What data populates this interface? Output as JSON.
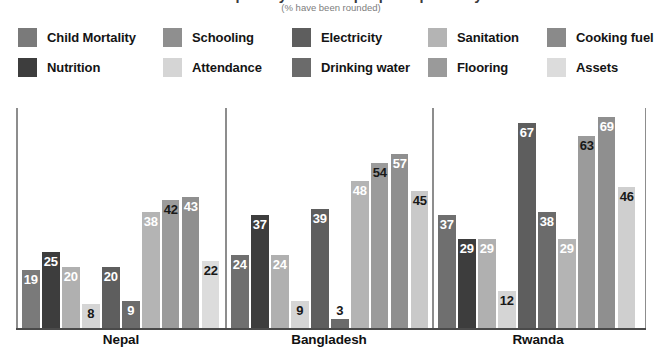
{
  "title": {
    "main": "Multidimensional poverty: share of people deprived by indicator",
    "sub": "(% have been rounded)"
  },
  "legend": {
    "columns": [
      [
        {
          "label": "Child Mortality",
          "color": "#7a7a7a",
          "swatch_name": "legend-swatch-child-mortality"
        },
        {
          "label": "Nutrition",
          "color": "#3d3d3d",
          "swatch_name": "legend-swatch-nutrition"
        }
      ],
      [
        {
          "label": "Schooling",
          "color": "#8f8f8f",
          "swatch_name": "legend-swatch-schooling"
        },
        {
          "label": "Attendance",
          "color": "#d5d5d5",
          "swatch_name": "legend-swatch-attendance"
        }
      ],
      [
        {
          "label": "Electricity",
          "color": "#5e5e5e",
          "swatch_name": "legend-swatch-electricity"
        },
        {
          "label": "Drinking water",
          "color": "#6b6b6b",
          "swatch_name": "legend-swatch-drinking-water"
        }
      ],
      [
        {
          "label": "Sanitation",
          "color": "#b4b4b4",
          "swatch_name": "legend-swatch-sanitation"
        },
        {
          "label": "Flooring",
          "color": "#9a9a9a",
          "swatch_name": "legend-swatch-flooring"
        }
      ],
      [
        {
          "label": "Cooking fuel",
          "color": "#8a8a8a",
          "swatch_name": "legend-swatch-cooking-fuel"
        },
        {
          "label": "Assets",
          "color": "#dcdcdc",
          "swatch_name": "legend-swatch-assets"
        }
      ]
    ]
  },
  "chart_data": {
    "type": "bar",
    "title": "Multidimensional poverty: share of people deprived by indicator",
    "subtitle": "(% have been rounded)",
    "xlabel": "",
    "ylabel": "",
    "ylim": [
      0,
      72
    ],
    "grid": false,
    "legend_position": "top",
    "categories": [
      "Nepal",
      "Bangladesh",
      "Rwanda"
    ],
    "indicators": [
      "Child Mortality",
      "Nutrition",
      "Schooling",
      "Attendance",
      "Electricity",
      "Drinking water",
      "Sanitation",
      "Cooking fuel",
      "Flooring",
      "Assets"
    ],
    "series": [
      {
        "name": "Child Mortality",
        "color": "#7a7a7a",
        "values": [
          19,
          24,
          37
        ]
      },
      {
        "name": "Nutrition",
        "color": "#3d3d3d",
        "values": [
          25,
          37,
          29
        ]
      },
      {
        "name": "Schooling",
        "color": "#9f9f9f",
        "values": [
          20,
          24,
          29
        ]
      },
      {
        "name": "Attendance",
        "color": "#d5d5d5",
        "values": [
          8,
          9,
          12
        ]
      },
      {
        "name": "Electricity",
        "color": "#5e5e5e",
        "values": [
          20,
          39,
          67
        ]
      },
      {
        "name": "Drinking water",
        "color": "#6b6b6b",
        "values": [
          9,
          3,
          38
        ]
      },
      {
        "name": "Sanitation",
        "color": "#b4b4b4",
        "values": [
          38,
          48,
          29
        ]
      },
      {
        "name": "Cooking fuel",
        "color": "#8a8a8a",
        "values": [
          42,
          54,
          63
        ]
      },
      {
        "name": "Flooring",
        "color": "#9a9a9a",
        "values": [
          43,
          57,
          69
        ]
      },
      {
        "name": "Assets",
        "color": "#dcdcdc",
        "values": [
          22,
          45,
          46
        ]
      }
    ],
    "panels": [
      {
        "country": "Nepal",
        "bars": [
          {
            "indicator": "Child Mortality",
            "value": 19,
            "color": "#7a7a7a",
            "label_tone": "light"
          },
          {
            "indicator": "Nutrition",
            "value": 25,
            "color": "#3d3d3d",
            "label_tone": "light"
          },
          {
            "indicator": "Schooling",
            "value": 20,
            "color": "#b0b0b0",
            "label_tone": "light"
          },
          {
            "indicator": "Attendance",
            "value": 8,
            "color": "#d5d5d5",
            "label_tone": "dark"
          },
          {
            "indicator": "Electricity",
            "value": 20,
            "color": "#5e5e5e",
            "label_tone": "light"
          },
          {
            "indicator": "Drinking water",
            "value": 9,
            "color": "#6b6b6b",
            "label_tone": "light"
          },
          {
            "indicator": "Sanitation",
            "value": 38,
            "color": "#b4b4b4",
            "label_tone": "light"
          },
          {
            "indicator": "Cooking fuel",
            "value": 42,
            "color": "#9b9b9b",
            "label_tone": "dark"
          },
          {
            "indicator": "Flooring",
            "value": 43,
            "color": "#8f8f8f",
            "label_tone": "light"
          },
          {
            "indicator": "Assets",
            "value": 22,
            "color": "#dcdcdc",
            "label_tone": "dark"
          }
        ]
      },
      {
        "country": "Bangladesh",
        "bars": [
          {
            "indicator": "Child Mortality",
            "value": 24,
            "color": "#6f6f6f",
            "label_tone": "light"
          },
          {
            "indicator": "Nutrition",
            "value": 37,
            "color": "#3d3d3d",
            "label_tone": "light"
          },
          {
            "indicator": "Schooling",
            "value": 24,
            "color": "#b0b0b0",
            "label_tone": "light"
          },
          {
            "indicator": "Attendance",
            "value": 9,
            "color": "#d5d5d5",
            "label_tone": "dark"
          },
          {
            "indicator": "Electricity",
            "value": 39,
            "color": "#5e5e5e",
            "label_tone": "light"
          },
          {
            "indicator": "Drinking water",
            "value": 3,
            "color": "#6b6b6b",
            "label_tone": "dark"
          },
          {
            "indicator": "Sanitation",
            "value": 48,
            "color": "#b4b4b4",
            "label_tone": "light"
          },
          {
            "indicator": "Cooking fuel",
            "value": 54,
            "color": "#9b9b9b",
            "label_tone": "dark"
          },
          {
            "indicator": "Flooring",
            "value": 57,
            "color": "#8f8f8f",
            "label_tone": "light"
          },
          {
            "indicator": "Assets",
            "value": 45,
            "color": "#c9c9c9",
            "label_tone": "dark"
          }
        ]
      },
      {
        "country": "Rwanda",
        "bars": [
          {
            "indicator": "Child Mortality",
            "value": 37,
            "color": "#6f6f6f",
            "label_tone": "light"
          },
          {
            "indicator": "Nutrition",
            "value": 29,
            "color": "#3d3d3d",
            "label_tone": "light"
          },
          {
            "indicator": "Schooling",
            "value": 29,
            "color": "#b0b0b0",
            "label_tone": "light"
          },
          {
            "indicator": "Attendance",
            "value": 12,
            "color": "#d5d5d5",
            "label_tone": "dark"
          },
          {
            "indicator": "Electricity",
            "value": 67,
            "color": "#5e5e5e",
            "label_tone": "light"
          },
          {
            "indicator": "Drinking water",
            "value": 38,
            "color": "#6b6b6b",
            "label_tone": "light"
          },
          {
            "indicator": "Sanitation",
            "value": 29,
            "color": "#b4b4b4",
            "label_tone": "light"
          },
          {
            "indicator": "Cooking fuel",
            "value": 63,
            "color": "#9b9b9b",
            "label_tone": "dark"
          },
          {
            "indicator": "Flooring",
            "value": 69,
            "color": "#8f8f8f",
            "label_tone": "light"
          },
          {
            "indicator": "Assets",
            "value": 46,
            "color": "#cfcfcf",
            "label_tone": "dark"
          }
        ]
      }
    ]
  },
  "axis": {
    "line_color": "#8d8d8d",
    "baseline_color": "#4a4a4a"
  }
}
